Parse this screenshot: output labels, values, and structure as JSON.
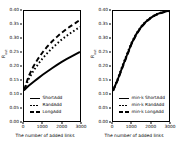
{
  "figure": {
    "panels": [
      {
        "id": "left",
        "xlabel": "The number of added links",
        "ylabel": "R_out",
        "yticks": [
          "0.00",
          "0.05",
          "0.10",
          "0.15",
          "0.20",
          "0.25",
          "0.30",
          "0.35",
          "0.40"
        ],
        "xticks": [
          "0",
          "1000",
          "2000",
          "3000"
        ],
        "legend": [
          {
            "label": "ShortAdd",
            "style": "solid"
          },
          {
            "label": "RandAdd",
            "style": "dotted"
          },
          {
            "label": "LongAdd",
            "style": "dashed"
          }
        ]
      },
      {
        "id": "right",
        "xlabel": "The number of added links",
        "ylabel": "R_out",
        "yticks": [
          "0.00",
          "0.05",
          "0.10",
          "0.15",
          "0.20",
          "0.25",
          "0.30",
          "0.35",
          "0.40"
        ],
        "xticks": [
          "0",
          "1000",
          "2000",
          "3000"
        ],
        "legend": [
          {
            "label": "min-k ShortAdd",
            "style": "solid"
          },
          {
            "label": "min-k RandAdd",
            "style": "dotted"
          },
          {
            "label": "min-k LongAdd",
            "style": "dashed"
          }
        ]
      }
    ]
  },
  "chart_data": [
    {
      "type": "line",
      "panel": "left",
      "title": "",
      "xlabel": "The number of added links",
      "ylabel": "R_out",
      "xlim": [
        0,
        3000
      ],
      "ylim": [
        0.0,
        0.4
      ],
      "xticks": [
        0,
        1000,
        2000,
        3000
      ],
      "yticks": [
        0.0,
        0.05,
        0.1,
        0.15,
        0.2,
        0.25,
        0.3,
        0.35,
        0.4
      ],
      "grid": false,
      "legend_position": "lower-left",
      "x": [
        0,
        250,
        500,
        750,
        1000,
        1250,
        1500,
        1750,
        2000,
        2250,
        2500,
        2750,
        3000
      ],
      "series": [
        {
          "name": "ShortAdd",
          "style": "solid",
          "color": "#000000",
          "values": [
            0.112,
            0.128,
            0.142,
            0.155,
            0.168,
            0.18,
            0.192,
            0.203,
            0.214,
            0.224,
            0.233,
            0.242,
            0.251
          ]
        },
        {
          "name": "RandAdd",
          "style": "dotted",
          "color": "#000000",
          "values": [
            0.112,
            0.152,
            0.182,
            0.206,
            0.228,
            0.247,
            0.264,
            0.28,
            0.295,
            0.308,
            0.32,
            0.331,
            0.342
          ]
        },
        {
          "name": "LongAdd",
          "style": "dashed",
          "color": "#000000",
          "values": [
            0.112,
            0.163,
            0.198,
            0.226,
            0.25,
            0.271,
            0.289,
            0.305,
            0.32,
            0.333,
            0.345,
            0.356,
            0.368
          ]
        }
      ]
    },
    {
      "type": "line",
      "panel": "right",
      "title": "",
      "xlabel": "The number of added links",
      "ylabel": "R_out",
      "xlim": [
        0,
        3000
      ],
      "ylim": [
        0.0,
        0.4
      ],
      "xticks": [
        0,
        1000,
        2000,
        3000
      ],
      "yticks": [
        0.0,
        0.05,
        0.1,
        0.15,
        0.2,
        0.25,
        0.3,
        0.35,
        0.4
      ],
      "grid": false,
      "legend_position": "lower-left",
      "x": [
        0,
        250,
        500,
        750,
        1000,
        1250,
        1500,
        1750,
        2000,
        2250,
        2500,
        2750,
        3000
      ],
      "series": [
        {
          "name": "min-k ShortAdd",
          "style": "solid",
          "color": "#000000",
          "values": [
            0.11,
            0.15,
            0.196,
            0.24,
            0.283,
            0.316,
            0.341,
            0.36,
            0.374,
            0.385,
            0.392,
            0.397,
            0.401
          ]
        },
        {
          "name": "min-k RandAdd",
          "style": "dotted",
          "color": "#000000",
          "values": [
            0.11,
            0.153,
            0.2,
            0.244,
            0.286,
            0.318,
            0.343,
            0.362,
            0.375,
            0.386,
            0.393,
            0.398,
            0.402
          ]
        },
        {
          "name": "min-k LongAdd",
          "style": "dashed",
          "color": "#000000",
          "values": [
            0.11,
            0.148,
            0.193,
            0.237,
            0.281,
            0.314,
            0.34,
            0.359,
            0.373,
            0.384,
            0.391,
            0.396,
            0.4
          ]
        }
      ]
    }
  ]
}
